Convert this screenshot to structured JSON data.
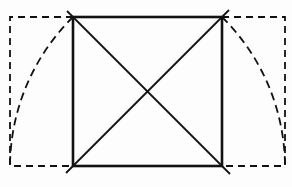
{
  "diagram": {
    "title": "Square with diagonals and rotated-diagonal root rectangle construction",
    "colors": {
      "ink": "#111111",
      "background": "#fdfdfd"
    },
    "square": {
      "x": 73,
      "y": 17,
      "size": 149
    },
    "left_dashed_rect": {
      "x1": 10,
      "y1": 17,
      "x2": 73,
      "y2": 166
    },
    "right_dashed_rect": {
      "x1": 222,
      "y1": 17,
      "x2": 285,
      "y2": 166
    },
    "diagonals": [
      {
        "from": [
          67,
          10
        ],
        "to": [
          232,
          176
        ]
      },
      {
        "from": [
          229,
          10
        ],
        "to": [
          66,
          173
        ]
      }
    ],
    "arcs": [
      {
        "center": [
          222,
          166
        ],
        "radius": 212,
        "start": [
          73,
          17
        ],
        "end": [
          10,
          166
        ]
      },
      {
        "center": [
          73,
          166
        ],
        "radius": 212,
        "start": [
          222,
          17
        ],
        "end": [
          285,
          166
        ]
      }
    ]
  }
}
